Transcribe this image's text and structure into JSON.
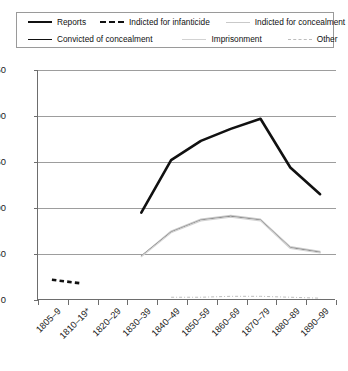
{
  "legend": {
    "items": [
      {
        "label": "Reports",
        "style": "solid-thick",
        "color": "#111111"
      },
      {
        "label": "Indicted for infanticide",
        "style": "dash-thick",
        "color": "#111111"
      },
      {
        "label": "Indicted for concealment",
        "style": "gray-thin",
        "color": "#c9c9c9"
      },
      {
        "label": "Convicted of concealment",
        "style": "solid-thin",
        "color": "#111111"
      },
      {
        "label": "Imprisonment",
        "style": "gray-thin",
        "color": "#d2d2d2"
      },
      {
        "label": "Other",
        "style": "gray-dash-dot",
        "color": "#bdbdbd"
      }
    ]
  },
  "axes": {
    "y_ticks": [
      "250",
      "200",
      "150",
      "100",
      "50",
      "0"
    ],
    "x_ticks": [
      "1805–9",
      "1810–19*",
      "1820–29",
      "1830–39",
      "1840–49",
      "1850–59",
      "1860–69",
      "1870–79",
      "1880–89",
      "1890–99"
    ]
  },
  "chart_data": {
    "type": "line",
    "title": "",
    "xlabel": "",
    "ylabel": "",
    "ylim": [
      0,
      250
    ],
    "ytick_step": 50,
    "grid": true,
    "legend_position": "top",
    "categories": [
      "1805–9",
      "1810–19*",
      "1820–29",
      "1830–39",
      "1840–49",
      "1850–59",
      "1860–69",
      "1870–79",
      "1880–89",
      "1890–99"
    ],
    "series": [
      {
        "name": "Reports",
        "style": "solid-thick",
        "color": "#111111",
        "values": [
          null,
          null,
          null,
          95,
          152,
          173,
          186,
          197,
          144,
          115
        ]
      },
      {
        "name": "Indicted for infanticide",
        "style": "dash-thick",
        "color": "#111111",
        "values": [
          22,
          18,
          null,
          18,
          null,
          null,
          null,
          null,
          null,
          null
        ]
      },
      {
        "name": "Indicted for concealment",
        "style": "gray-thin",
        "color": "#c9c9c9",
        "values": [
          null,
          null,
          null,
          48,
          75,
          88,
          92,
          88,
          58,
          53
        ]
      },
      {
        "name": "Convicted of concealment",
        "style": "solid-thin",
        "color": "#8a8a8a",
        "values": [
          null,
          null,
          null,
          48,
          74,
          87,
          91,
          87,
          57,
          52
        ]
      },
      {
        "name": "Imprisonment",
        "style": "gray-thin",
        "color": "#d2d2d2",
        "values": [
          null,
          null,
          null,
          47,
          73,
          86,
          90,
          86,
          56,
          51
        ]
      },
      {
        "name": "Other",
        "style": "gray-dash-dot",
        "color": "#bdbdbd",
        "values": [
          null,
          null,
          null,
          null,
          3,
          3,
          4,
          4,
          3,
          2
        ]
      }
    ]
  }
}
